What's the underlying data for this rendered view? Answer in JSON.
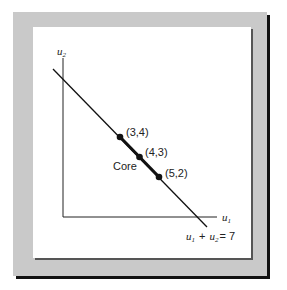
{
  "figure": {
    "axes": {
      "x_label": "u",
      "x_label_sub": "1",
      "y_label": "u",
      "y_label_sub": "2"
    },
    "line_equation": {
      "left_var": "u",
      "left_sub": "1",
      "plus": "+",
      "right_var": "u",
      "right_sub": "2",
      "equals": "= 7"
    },
    "core_label": "Core",
    "points": [
      {
        "label": "(3,4)",
        "u1": 3,
        "u2": 4
      },
      {
        "label": "(4,3)",
        "u1": 4,
        "u2": 3
      },
      {
        "label": "(5,2)",
        "u1": 5,
        "u2": 2
      }
    ],
    "colors": {
      "frame": "#c9c9c9",
      "shadow": "#111111",
      "line": "#111111",
      "panel": "#ffffff"
    }
  }
}
